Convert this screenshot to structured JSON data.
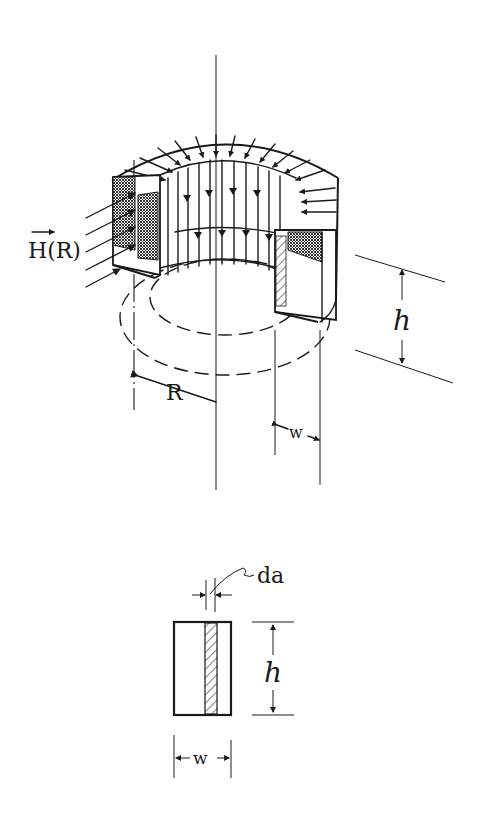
{
  "figure": {
    "perspective_view": {
      "field_label": "H(R)",
      "field_label_has_vector_arrow": true,
      "radius_label": "R",
      "width_label": "w",
      "height_label": "h"
    },
    "cross_section": {
      "strip_label": "da",
      "height_label": "h",
      "width_label": "w"
    }
  },
  "colors": {
    "ink": "#1a1a1a",
    "background": "#ffffff"
  }
}
